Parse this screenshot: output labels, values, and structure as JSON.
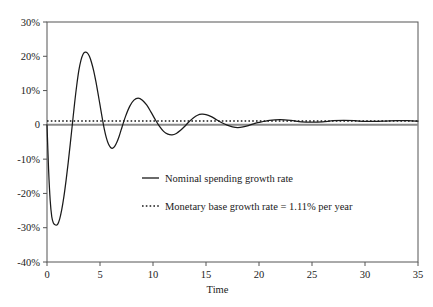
{
  "chart_data": {
    "type": "line",
    "title": "",
    "xlabel": "Time",
    "ylabel": "",
    "xlim": [
      0,
      35
    ],
    "ylim": [
      -40,
      30
    ],
    "grid": false,
    "legend_position": "center",
    "xticks": [
      0,
      5,
      10,
      15,
      20,
      25,
      30,
      35
    ],
    "xtick_labels": [
      "0",
      "5",
      "10",
      "15",
      "20",
      "25",
      "30",
      "35"
    ],
    "yticks": [
      30,
      20,
      10,
      0,
      -10,
      -20,
      -30,
      -40
    ],
    "ytick_labels": [
      "30%",
      "20%",
      "10%",
      "0",
      "-10%",
      "-20%",
      "-30%",
      "-40%"
    ],
    "annotations": [
      "Monetary base growth rate = 1.11% per year"
    ],
    "series": [
      {
        "name": "Nominal spending growth rate",
        "style": "solid",
        "color": "#1a1a1a",
        "x": [
          0,
          0.15,
          0.3,
          0.45,
          0.6,
          0.8,
          1.0,
          1.2,
          1.4,
          1.6,
          1.8,
          2.0,
          2.2,
          2.4,
          2.6,
          2.8,
          3.0,
          3.2,
          3.4,
          3.6,
          3.8,
          4.0,
          4.2,
          4.4,
          4.6,
          4.8,
          5.0,
          5.2,
          5.4,
          5.6,
          5.8,
          6.0,
          6.2,
          6.4,
          6.6,
          6.8,
          7.0,
          7.4,
          7.8,
          8.2,
          8.6,
          9.0,
          9.4,
          9.8,
          10.2,
          10.6,
          11.0,
          11.4,
          11.8,
          12.2,
          12.6,
          13.0,
          13.4,
          13.8,
          14.2,
          14.6,
          15.0,
          15.5,
          16.0,
          16.5,
          17.0,
          17.5,
          18.0,
          18.5,
          19.0,
          19.5,
          20.0,
          21.0,
          22.0,
          23.0,
          24.0,
          25.0,
          26.0,
          27.0,
          28.0,
          29.0,
          30.0,
          31.0,
          32.0,
          33.0,
          34.0,
          35.0
        ],
        "y": [
          0.0,
          -13.0,
          -22.0,
          -26.8,
          -28.6,
          -29.2,
          -29.0,
          -27.4,
          -24.6,
          -20.8,
          -16.2,
          -11.0,
          -5.4,
          0.4,
          6.2,
          11.4,
          15.8,
          18.8,
          20.6,
          21.2,
          21.0,
          20.0,
          18.2,
          15.8,
          12.8,
          9.4,
          5.8,
          2.2,
          -1.2,
          -3.8,
          -5.6,
          -6.6,
          -6.8,
          -6.2,
          -5.0,
          -3.4,
          -1.4,
          2.4,
          5.4,
          7.2,
          7.8,
          7.2,
          5.8,
          3.8,
          1.6,
          -0.4,
          -1.9,
          -2.7,
          -2.9,
          -2.5,
          -1.6,
          -0.4,
          0.9,
          2.0,
          2.8,
          3.1,
          3.0,
          2.4,
          1.5,
          0.6,
          -0.1,
          -0.6,
          -0.8,
          -0.6,
          -0.2,
          0.3,
          0.7,
          1.3,
          1.5,
          1.3,
          0.9,
          0.8,
          0.9,
          1.2,
          1.3,
          1.2,
          1.0,
          1.0,
          1.1,
          1.2,
          1.2,
          1.1
        ]
      },
      {
        "name": "Monetary base growth rate = 1.11% per year",
        "style": "dotted",
        "color": "#1a1a1a",
        "constant_value": 1.11,
        "x": [
          0,
          35
        ],
        "y": [
          1.11,
          1.11
        ]
      }
    ]
  },
  "legend": {
    "entries": [
      {
        "label": "Nominal spending growth rate",
        "style": "solid"
      },
      {
        "label": "Monetary base growth rate = 1.11% per year",
        "style": "dotted"
      }
    ]
  },
  "axis": {
    "x_title": "Time"
  }
}
